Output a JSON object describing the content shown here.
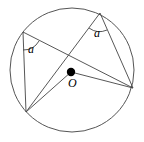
{
  "figure": {
    "background_color": "#ffffff",
    "stroke_color": "#444444",
    "dot_color": "#000000",
    "stroke_width": 0.9
  },
  "circle": {
    "name": "circumcircle",
    "cx": 72,
    "cy": 70,
    "r": 62
  },
  "center_point": {
    "label": "O",
    "x": 71,
    "y": 72,
    "dot_radius": 4.2
  },
  "vertices": [
    {
      "id": "top-left",
      "label": "",
      "x": 23,
      "y": 32
    },
    {
      "id": "top-right",
      "label": "",
      "x": 100,
      "y": 13
    },
    {
      "id": "right",
      "label": "",
      "x": 133,
      "y": 88
    },
    {
      "id": "bottom-left",
      "label": "",
      "x": 26,
      "y": 112
    }
  ],
  "chords": [
    {
      "id": "chord-topleft-right",
      "from": "top-left",
      "to": "right"
    },
    {
      "id": "chord-topleft-bottomleft",
      "from": "top-left",
      "to": "bottom-left"
    },
    {
      "id": "chord-topright-bottomleft",
      "from": "top-right",
      "to": "bottom-left"
    },
    {
      "id": "chord-topright-right",
      "from": "top-right",
      "to": "right"
    }
  ],
  "radii": [
    {
      "id": "radius-to-bottomleft",
      "from": "center",
      "to": "bottom-left"
    },
    {
      "id": "radius-to-right",
      "from": "center",
      "to": "right"
    }
  ],
  "angle_marks": [
    {
      "id": "angle-a-left",
      "label": "a",
      "at_vertex": "top-left",
      "label_x": 28,
      "label_y": 43,
      "arc": "M 23 50 A 18 18 0 0 0 39 41"
    },
    {
      "id": "angle-a-right",
      "label": "a",
      "at_vertex": "top-right",
      "label_x": 94,
      "label_y": 27,
      "arc": "M 89 28 A 18 18 0 0 0 107 30"
    }
  ]
}
